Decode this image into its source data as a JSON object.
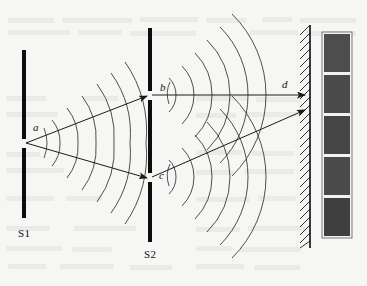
{
  "figure": {
    "background_color": "#f6f6f4",
    "ink_color": "#111111",
    "wave_color": "#3a3a3a",
    "fringe_color": "#4a4a4a"
  },
  "labels": {
    "slit_a": "a",
    "slit_b": "b",
    "slit_c": "c",
    "ray_d": "d",
    "barrier_1": "S1",
    "barrier_2": "S2"
  },
  "barriers": [
    {
      "name": "S1",
      "label": "S1",
      "x": 22,
      "top": 50,
      "bottom": 218,
      "slits": [
        {
          "label": "a",
          "y": 143,
          "gap": 9
        }
      ]
    },
    {
      "name": "S2",
      "label": "S2",
      "x": 148,
      "top": 28,
      "bottom": 242,
      "slits": [
        {
          "label": "b",
          "y": 95,
          "gap": 9
        },
        {
          "label": "c",
          "y": 177,
          "gap": 9
        }
      ]
    }
  ],
  "screen": {
    "name": "observation-screen",
    "x": 310,
    "top": 25,
    "bottom": 248,
    "hatching": "diagonal"
  },
  "fringe_pattern": {
    "x": 322,
    "width": 30,
    "top": 32,
    "bottom": 238,
    "band_count": 5,
    "band_color": "#4a4a4a"
  },
  "rays": [
    {
      "name": "ray-a-to-b",
      "from": "a",
      "to": "b",
      "arrow": true
    },
    {
      "name": "ray-a-to-c",
      "from": "a",
      "to": "c",
      "arrow": true
    },
    {
      "name": "ray-b-to-screen",
      "from": "b",
      "to": "d",
      "arrow": true
    },
    {
      "name": "ray-c-to-screen",
      "from": "c",
      "to": "screen",
      "arrow": true
    }
  ],
  "wavefronts": {
    "source_a": {
      "center_x": 26,
      "center_y": 143,
      "count": 6
    },
    "source_b": {
      "center_x": 152,
      "center_y": 95,
      "count": 6
    },
    "source_c": {
      "center_x": 152,
      "center_y": 177,
      "count": 6
    }
  }
}
